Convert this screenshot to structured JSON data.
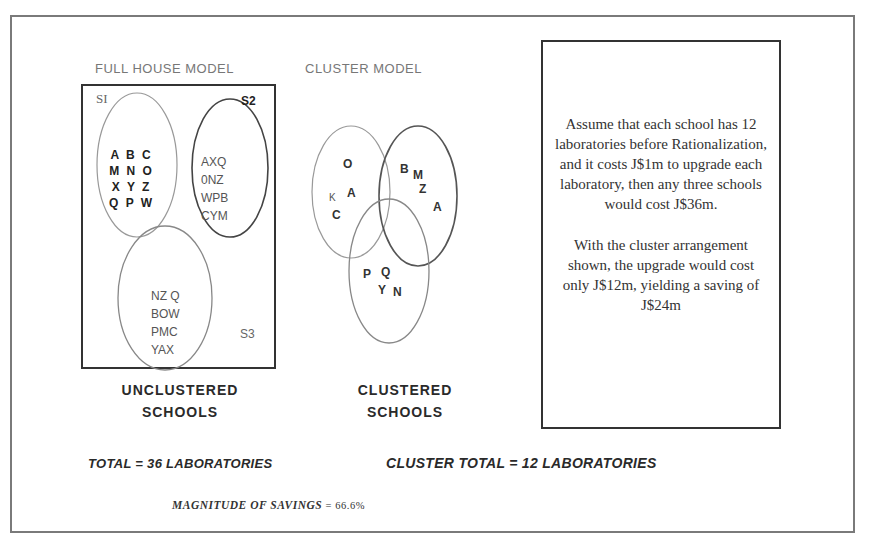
{
  "full_house_model": {
    "title": "FULL HOUSE MODEL",
    "sets": [
      {
        "label": "SI",
        "members": [
          "A B C",
          "M N O",
          "X Y Z",
          "Q P W"
        ]
      },
      {
        "label": "S2",
        "members": [
          "AXQ",
          "0NZ",
          "WPB",
          "CYM"
        ]
      },
      {
        "label": "S3",
        "members": [
          "NZ Q",
          "BOW",
          "PMC",
          "YAX"
        ]
      }
    ],
    "caption_line1": "UNCLUSTERED",
    "caption_line2": "SCHOOLS",
    "total": "TOTAL = 36 LABORATORIES"
  },
  "cluster_model": {
    "title": "CLUSTER MODEL",
    "letters": [
      {
        "char": "O",
        "region": "left"
      },
      {
        "char": "K",
        "region": "left"
      },
      {
        "char": "A",
        "region": "left"
      },
      {
        "char": "C",
        "region": "left"
      },
      {
        "char": "B",
        "region": "right"
      },
      {
        "char": "M",
        "region": "right"
      },
      {
        "char": "Z",
        "region": "right"
      },
      {
        "char": "A",
        "region": "right"
      },
      {
        "char": "P",
        "region": "bottom"
      },
      {
        "char": "Q",
        "region": "bottom"
      },
      {
        "char": "Y",
        "region": "bottom"
      },
      {
        "char": "N",
        "region": "bottom"
      }
    ],
    "caption_line1": "CLUSTERED",
    "caption_line2": "SCHOOLS",
    "total": "CLUSTER TOTAL = 12 LABORATORIES"
  },
  "explanation": {
    "paragraph1": "Assume that each school has 12 laboratories before Rationalization, and it costs J$1m to upgrade each laboratory, then any three schools would cost J$36m.",
    "paragraph2": "With the cluster arrangement shown, the upgrade would cost only J$12m, yielding a saving of J$24m"
  },
  "summary": {
    "magnitude_label": "MAGNITUDE OF SAVINGS",
    "equals": "=",
    "magnitude_value": "66.6%"
  },
  "colors": {
    "frame": "#7a7a7a",
    "ink": "#222222",
    "ellipse_stroke": "#888888"
  }
}
